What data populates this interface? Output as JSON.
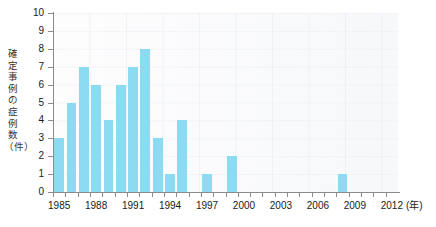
{
  "chart_data": {
    "type": "bar",
    "title": "",
    "xlabel": "(年)",
    "ylabel": "確定事例の症例数（件）",
    "ylim": [
      0,
      10
    ],
    "xlim": [
      1985,
      2013
    ],
    "grid": true,
    "legend": null,
    "y_ticks": [
      0,
      1,
      2,
      3,
      4,
      5,
      6,
      7,
      8,
      9,
      10
    ],
    "x_tick_years": [
      1985,
      1986,
      1987,
      1988,
      1989,
      1990,
      1991,
      1992,
      1993,
      1994,
      1995,
      1996,
      1997,
      1998,
      1999,
      2000,
      2001,
      2002,
      2003,
      2004,
      2005,
      2006,
      2007,
      2008,
      2009,
      2010,
      2011,
      2012
    ],
    "x_labeled_years": [
      1985,
      1988,
      1991,
      1994,
      1997,
      2000,
      2003,
      2006,
      2009,
      2012
    ],
    "categories": [
      1985,
      1986,
      1987,
      1988,
      1989,
      1990,
      1991,
      1992,
      1993,
      1994,
      1995,
      1996,
      1997,
      1998,
      1999,
      2000,
      2001,
      2002,
      2003,
      2004,
      2005,
      2006,
      2007,
      2008,
      2009,
      2010,
      2011,
      2012
    ],
    "values": [
      3,
      5,
      7,
      6,
      4,
      6,
      7,
      8,
      3,
      1,
      4,
      0,
      1,
      0,
      2,
      0,
      0,
      0,
      0,
      0,
      0,
      0,
      0,
      1,
      0,
      0,
      0,
      0
    ],
    "bar_color": "#8cdbf2"
  },
  "y_axis": {
    "title_chars": [
      "確",
      "定",
      "事",
      "例",
      "の",
      "症",
      "例",
      "数",
      "（件）"
    ]
  },
  "x_axis": {
    "unit_label": "(年)"
  }
}
